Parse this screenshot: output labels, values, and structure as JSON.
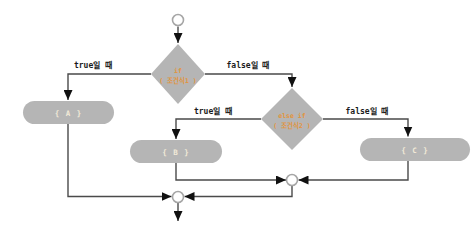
{
  "diagram": {
    "type": "flowchart",
    "colors": {
      "background": "#ffffff",
      "node_fill": "#b5b5b5",
      "condition_text": "#e2943e",
      "block_text": "#f2ead8",
      "line": "#4a4a4a",
      "arrow": "#111111",
      "terminal_fill": "#ffffff",
      "terminal_stroke": "#a6a6a6",
      "label_text": "#1a1a1a"
    },
    "nodes": {
      "if_diamond": {
        "line1": "if",
        "line2": "( 조건식1 )"
      },
      "elseif_diamond": {
        "line1": "else if",
        "line2": "( 조건식2 )"
      },
      "block_a": "{ A }",
      "block_b": "{ B }",
      "block_c": "{ C }"
    },
    "edge_labels": {
      "if_true": "true일 때",
      "if_false": "false일 때",
      "elseif_true": "true일 때",
      "elseif_false": "false일 때"
    }
  }
}
